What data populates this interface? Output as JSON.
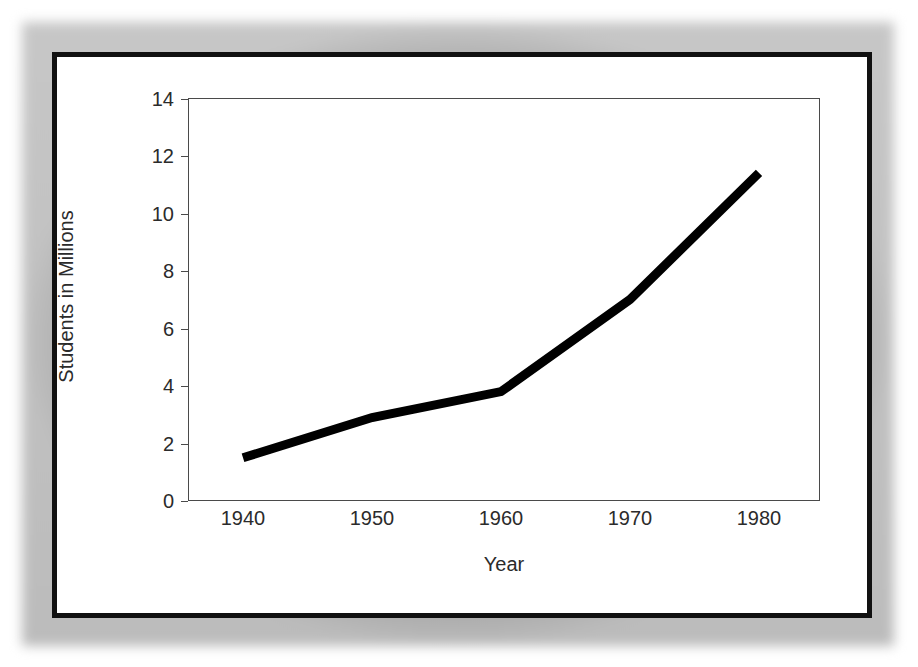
{
  "chart_data": {
    "type": "line",
    "title": "",
    "xlabel": "Year",
    "ylabel": "Students in Millions",
    "x": [
      1940,
      1950,
      1960,
      1970,
      1980
    ],
    "values": [
      1.5,
      2.9,
      3.8,
      7.0,
      11.4
    ],
    "series": [
      {
        "name": "Students in Millions",
        "values": [
          1.5,
          2.9,
          3.8,
          7.0,
          11.4
        ]
      }
    ],
    "xticklabels": [
      "1940",
      "1950",
      "1960",
      "1970",
      "1980"
    ],
    "yticklabels": [
      "0",
      "2",
      "4",
      "6",
      "8",
      "10",
      "12",
      "14"
    ],
    "yticks": [
      0,
      2,
      4,
      6,
      8,
      10,
      12,
      14
    ],
    "xlim": [
      1936,
      1985
    ],
    "ylim": [
      0,
      14
    ],
    "grid": false,
    "legend": false,
    "legend_position": "none",
    "line_color": "#000000",
    "line_width": 9,
    "axis_color": "#4a4a4a",
    "frame_color": "#111111",
    "background_color": "#ffffff"
  },
  "figure": {
    "axis_labels": {
      "x": "Year",
      "y": "Students in Millions"
    }
  }
}
